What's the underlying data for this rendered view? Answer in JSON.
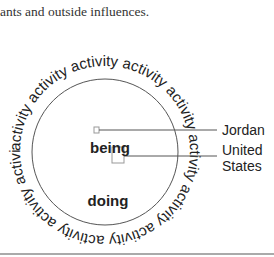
{
  "caption": "ants and outside influences.",
  "diagram": {
    "ring_word": "activity",
    "ring_text": "activity activity activity activity activity activity activity activity activity activity activity",
    "inner_top_label": "being",
    "inner_bottom_label": "doing",
    "callouts": [
      {
        "label": "Jordan"
      },
      {
        "label_line1": "United",
        "label_line2": "States"
      }
    ],
    "colors": {
      "line": "#555555",
      "text": "#222222",
      "marker": "#999999"
    }
  }
}
